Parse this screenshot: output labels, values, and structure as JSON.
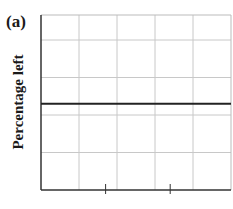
{
  "chart_data": {
    "type": "line",
    "panel_label": "(a)",
    "title": "",
    "xlabel": "",
    "ylabel": "Percentage left",
    "grid": true,
    "x_gridlines": 5,
    "y_gridlines": [
      1,
      2,
      3,
      4
    ],
    "ylim": [
      0,
      5
    ],
    "xlim": [
      0,
      5
    ],
    "x_ticks_visible": [
      1.7,
      3.4
    ],
    "series": [
      {
        "name": "constant",
        "x": [
          0,
          5
        ],
        "y": [
          2.3,
          2.3
        ],
        "color": "#222222"
      }
    ],
    "colors": {
      "grid": "#c8c8c8",
      "axis": "#333333",
      "line": "#222222"
    }
  }
}
